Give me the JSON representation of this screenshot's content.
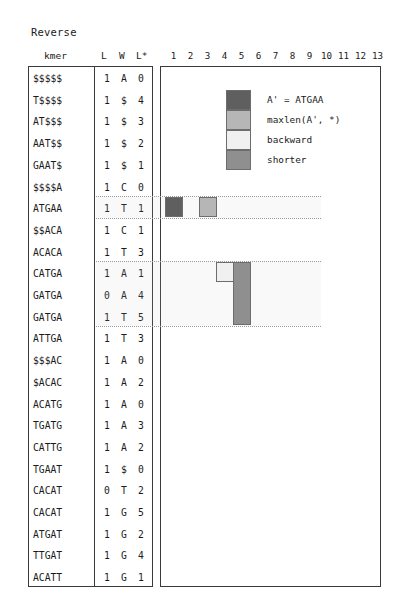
{
  "title": "Reverse",
  "table": {
    "headers": {
      "kmer": "kmer",
      "l": "L",
      "w": "W",
      "lstar": "L*"
    },
    "rows": [
      {
        "kmer": "$$$$$",
        "l": "1",
        "w": "A",
        "lstar": "0"
      },
      {
        "kmer": "T$$$$",
        "l": "1",
        "w": "$",
        "lstar": "4"
      },
      {
        "kmer": "AT$$$",
        "l": "1",
        "w": "$",
        "lstar": "3"
      },
      {
        "kmer": "AAT$$",
        "l": "1",
        "w": "$",
        "lstar": "2"
      },
      {
        "kmer": "GAAT$",
        "l": "1",
        "w": "$",
        "lstar": "1"
      },
      {
        "kmer": "$$$$A",
        "l": "1",
        "w": "C",
        "lstar": "0"
      },
      {
        "kmer": "ATGAA",
        "l": "1",
        "w": "T",
        "lstar": "1"
      },
      {
        "kmer": "$$ACA",
        "l": "1",
        "w": "C",
        "lstar": "1"
      },
      {
        "kmer": "ACACA",
        "l": "1",
        "w": "T",
        "lstar": "3"
      },
      {
        "kmer": "CATGA",
        "l": "1",
        "w": "A",
        "lstar": "1"
      },
      {
        "kmer": "GATGA",
        "l": "0",
        "w": "A",
        "lstar": "4"
      },
      {
        "kmer": "GATGA",
        "l": "1",
        "w": "T",
        "lstar": "5"
      },
      {
        "kmer": "ATTGA",
        "l": "1",
        "w": "T",
        "lstar": "3"
      },
      {
        "kmer": "$$$AC",
        "l": "1",
        "w": "A",
        "lstar": "0"
      },
      {
        "kmer": "$ACAC",
        "l": "1",
        "w": "A",
        "lstar": "2"
      },
      {
        "kmer": "ACATG",
        "l": "1",
        "w": "A",
        "lstar": "0"
      },
      {
        "kmer": "TGATG",
        "l": "1",
        "w": "A",
        "lstar": "3"
      },
      {
        "kmer": "CATTG",
        "l": "1",
        "w": "A",
        "lstar": "2"
      },
      {
        "kmer": "TGAAT",
        "l": "1",
        "w": "$",
        "lstar": "0"
      },
      {
        "kmer": "CACAT",
        "l": "0",
        "w": "T",
        "lstar": "2"
      },
      {
        "kmer": "CACAT",
        "l": "1",
        "w": "G",
        "lstar": "5"
      },
      {
        "kmer": "ATGAT",
        "l": "1",
        "w": "G",
        "lstar": "2"
      },
      {
        "kmer": "TTGAT",
        "l": "1",
        "w": "G",
        "lstar": "4"
      },
      {
        "kmer": "ACATT",
        "l": "1",
        "w": "G",
        "lstar": "1"
      }
    ]
  },
  "chart_data": {
    "type": "heatmap",
    "title": "Reverse",
    "xlabel": "",
    "ylabel": "",
    "grid": false,
    "legend_position": "inside-top",
    "columns": [
      "1",
      "2",
      "3",
      "4",
      "5",
      "6",
      "7",
      "8",
      "9",
      "10",
      "11",
      "12",
      "13"
    ],
    "xlim": [
      1,
      13
    ],
    "row_labels": [
      "$$$$$",
      "T$$$$",
      "AT$$$",
      "AAT$$",
      "GAAT$",
      "$$$$A",
      "ATGAA",
      "$$ACA",
      "ACACA",
      "CATGA",
      "GATGA",
      "GATGA",
      "ATTGA",
      "$$$AC",
      "$ACAC",
      "ACATG",
      "TGATG",
      "CATTG",
      "TGAAT",
      "CACAT",
      "CACAT",
      "ATGAT",
      "TTGAT",
      "ACATT"
    ],
    "colors": {
      "current": "#5f5f5f",
      "maxlen": "#b6b6b6",
      "backward": "#f0f0f0",
      "shorter": "#8f8f8f",
      "border": "#6d6d6d",
      "axis": "#3a3a3a"
    },
    "cells": [
      {
        "row_index": 6,
        "row_label": "ATGAA",
        "column": 1,
        "span_rows": 1,
        "category": "current",
        "color": "#5f5f5f"
      },
      {
        "row_index": 6,
        "row_label": "ATGAA",
        "column": 3,
        "span_rows": 1,
        "category": "maxlen",
        "color": "#b6b6b6"
      },
      {
        "row_index": 9,
        "row_label": "CATGA",
        "column": 4,
        "span_rows": 1,
        "category": "backward",
        "color": "#f0f0f0"
      },
      {
        "row_index": 9,
        "row_label": "CATGA",
        "column": 5,
        "span_rows": 3,
        "category": "shorter",
        "color": "#8f8f8f"
      }
    ],
    "guides": [
      {
        "from_row": 6,
        "to_row": 6
      },
      {
        "from_row": 9,
        "to_row": 11
      }
    ]
  },
  "legend": {
    "items": [
      {
        "label": "A' = ATGAA",
        "swatch": "#5f5f5f",
        "name": "current"
      },
      {
        "label": "maxlen(A', *)",
        "swatch": "#b6b6b6",
        "name": "maxlen"
      },
      {
        "label": "backward",
        "swatch": "#f0f0f0",
        "name": "backward"
      },
      {
        "label": "shorter",
        "swatch": "#8f8f8f",
        "name": "shorter"
      }
    ]
  }
}
